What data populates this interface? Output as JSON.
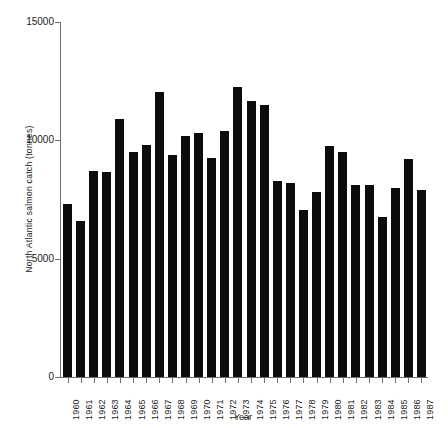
{
  "chart_data": {
    "type": "bar",
    "title": "",
    "xlabel": "Year",
    "ylabel": "North Atlantic salmon catch (tonnes)",
    "ylim": [
      0,
      15000
    ],
    "yticks": [
      0,
      5000,
      10000,
      15000
    ],
    "ytick_labels": [
      "0",
      "5000",
      "10000",
      "15000"
    ],
    "grid": false,
    "legend": null,
    "bar_color": "#0c0c0c",
    "axis_color": "#6e6e6e",
    "categories": [
      "1960",
      "1961",
      "1962",
      "1963",
      "1964",
      "1965",
      "1966",
      "1967",
      "1968",
      "1969",
      "1970",
      "1971",
      "1972",
      "1973",
      "1974",
      "1975",
      "1976",
      "1977",
      "1978",
      "1979",
      "1980",
      "1981",
      "1982",
      "1983",
      "1984",
      "1985",
      "1986",
      "1987"
    ],
    "values": [
      7300,
      6600,
      8700,
      8650,
      10900,
      9500,
      9800,
      12050,
      9400,
      10200,
      10300,
      9250,
      10400,
      12250,
      11650,
      11500,
      8300,
      8200,
      7050,
      7800,
      9750,
      9500,
      8100,
      8100,
      6750,
      8000,
      9200,
      7900
    ],
    "series": [
      {
        "name": "North Atlantic salmon catch",
        "values": [
          7300,
          6600,
          8700,
          8650,
          10900,
          9500,
          9800,
          12050,
          9400,
          10200,
          10300,
          9250,
          10400,
          12250,
          11650,
          11500,
          8300,
          8200,
          7050,
          7800,
          9750,
          9500,
          8100,
          8100,
          6750,
          8000,
          9200,
          7900
        ]
      }
    ]
  }
}
